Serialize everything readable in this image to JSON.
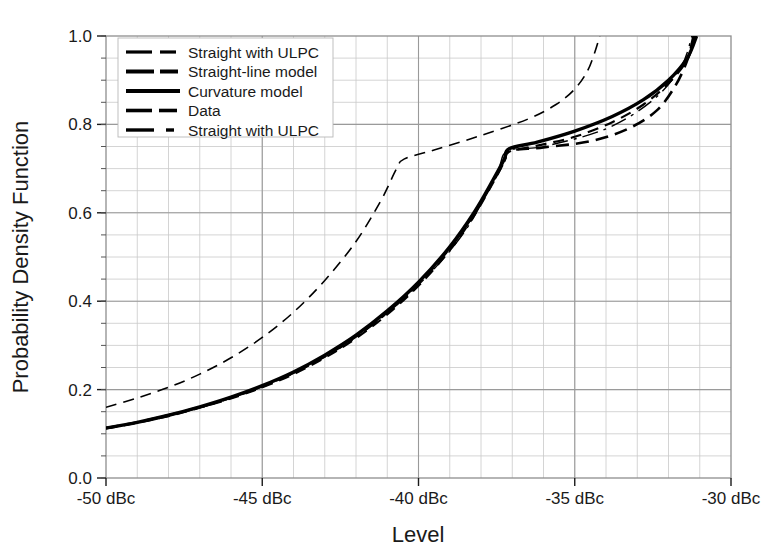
{
  "chart_data": {
    "type": "line",
    "title": "",
    "xlabel": "Level",
    "ylabel": "Probability Density Function",
    "xlim": [
      -50,
      -30
    ],
    "ylim": [
      0.0,
      1.0
    ],
    "grid": true,
    "legend_position": "top-left",
    "x_tick_labels": [
      "-50 dBc",
      "-45 dBc",
      "-40 dBc",
      "-35 dBc",
      "-30 dBc"
    ],
    "x_tick_values": [
      -50,
      -45,
      -40,
      -35,
      -30
    ],
    "y_tick_labels": [
      "0.0",
      "0.2",
      "0.4",
      "0.6",
      "0.8",
      "1.0"
    ],
    "y_tick_values": [
      0.0,
      0.2,
      0.4,
      0.6,
      0.8,
      1.0
    ],
    "x_minor_step": 1,
    "y_minor_step": 0.05,
    "series": [
      {
        "name": "Straight with ULPC",
        "style": "dashed",
        "width": 1.6,
        "points": [
          [
            -50.0,
            0.16
          ],
          [
            -49.0,
            0.181
          ],
          [
            -48.0,
            0.205
          ],
          [
            -47.0,
            0.235
          ],
          [
            -46.0,
            0.272
          ],
          [
            -45.0,
            0.318
          ],
          [
            -44.0,
            0.375
          ],
          [
            -43.0,
            0.447
          ],
          [
            -42.0,
            0.535
          ],
          [
            -41.2,
            0.628
          ],
          [
            -40.7,
            0.7
          ],
          [
            -40.45,
            0.722
          ],
          [
            -39.5,
            0.742
          ],
          [
            -38.0,
            0.775
          ],
          [
            -36.5,
            0.812
          ],
          [
            -35.6,
            0.845
          ],
          [
            -35.0,
            0.88
          ],
          [
            -34.6,
            0.92
          ],
          [
            -34.35,
            0.965
          ],
          [
            -34.2,
            1.0
          ]
        ]
      },
      {
        "name": "Straight-line model",
        "style": "dashed",
        "width": 2.6,
        "points": [
          [
            -50.0,
            0.113
          ],
          [
            -49.0,
            0.126
          ],
          [
            -48.0,
            0.142
          ],
          [
            -47.0,
            0.16
          ],
          [
            -46.0,
            0.182
          ],
          [
            -45.0,
            0.207
          ],
          [
            -44.0,
            0.238
          ],
          [
            -43.0,
            0.275
          ],
          [
            -42.0,
            0.32
          ],
          [
            -41.0,
            0.375
          ],
          [
            -40.0,
            0.44
          ],
          [
            -39.0,
            0.52
          ],
          [
            -38.2,
            0.6
          ],
          [
            -37.6,
            0.672
          ],
          [
            -37.25,
            0.718
          ],
          [
            -37.1,
            0.74
          ],
          [
            -36.0,
            0.748
          ],
          [
            -34.5,
            0.762
          ],
          [
            -33.3,
            0.79
          ],
          [
            -32.4,
            0.83
          ],
          [
            -31.8,
            0.885
          ],
          [
            -31.4,
            0.945
          ],
          [
            -31.2,
            1.0
          ]
        ]
      },
      {
        "name": "Curvature model",
        "style": "solid",
        "width": 3.4,
        "points": [
          [
            -50.0,
            0.113
          ],
          [
            -49.0,
            0.126
          ],
          [
            -48.0,
            0.142
          ],
          [
            -47.0,
            0.161
          ],
          [
            -46.0,
            0.183
          ],
          [
            -45.0,
            0.209
          ],
          [
            -44.0,
            0.24
          ],
          [
            -43.0,
            0.278
          ],
          [
            -42.0,
            0.323
          ],
          [
            -41.0,
            0.378
          ],
          [
            -40.0,
            0.443
          ],
          [
            -39.0,
            0.523
          ],
          [
            -38.2,
            0.603
          ],
          [
            -37.6,
            0.676
          ],
          [
            -37.25,
            0.722
          ],
          [
            -37.1,
            0.745
          ],
          [
            -36.2,
            0.76
          ],
          [
            -35.0,
            0.785
          ],
          [
            -33.8,
            0.818
          ],
          [
            -32.8,
            0.856
          ],
          [
            -32.0,
            0.9
          ],
          [
            -31.4,
            0.95
          ],
          [
            -31.1,
            1.0
          ]
        ]
      },
      {
        "name": "Data",
        "style": "dashed",
        "width": 2.2,
        "points": [
          [
            -50.0,
            0.112
          ],
          [
            -49.0,
            0.125
          ],
          [
            -48.0,
            0.14
          ],
          [
            -47.0,
            0.159
          ],
          [
            -46.0,
            0.18
          ],
          [
            -45.0,
            0.205
          ],
          [
            -44.0,
            0.235
          ],
          [
            -43.0,
            0.272
          ],
          [
            -42.0,
            0.316
          ],
          [
            -41.0,
            0.37
          ],
          [
            -40.0,
            0.435
          ],
          [
            -39.0,
            0.515
          ],
          [
            -38.2,
            0.596
          ],
          [
            -37.6,
            0.67
          ],
          [
            -37.25,
            0.716
          ],
          [
            -37.1,
            0.738
          ],
          [
            -36.2,
            0.752
          ],
          [
            -35.0,
            0.772
          ],
          [
            -33.8,
            0.805
          ],
          [
            -32.8,
            0.845
          ],
          [
            -32.0,
            0.893
          ],
          [
            -31.4,
            0.946
          ],
          [
            -31.15,
            1.0
          ]
        ]
      },
      {
        "name": "Straight with ULPC",
        "style": "dashdot",
        "width": 1.4,
        "points": [
          [
            -50.0,
            0.112
          ],
          [
            -48.0,
            0.141
          ],
          [
            -46.0,
            0.181
          ],
          [
            -44.0,
            0.237
          ],
          [
            -42.0,
            0.318
          ],
          [
            -40.0,
            0.437
          ],
          [
            -38.5,
            0.56
          ],
          [
            -37.5,
            0.69
          ],
          [
            -37.15,
            0.74
          ],
          [
            -36.0,
            0.75
          ],
          [
            -34.0,
            0.79
          ],
          [
            -32.5,
            0.855
          ],
          [
            -31.6,
            0.93
          ],
          [
            -31.25,
            1.0
          ]
        ]
      }
    ]
  },
  "legend": {
    "entries": [
      {
        "label": "Straight with ULPC",
        "style": "dashed-thin"
      },
      {
        "label": "Straight-line model",
        "style": "dashed-thick"
      },
      {
        "label": "Curvature model",
        "style": "solid"
      },
      {
        "label": "Data",
        "style": "dashed-med"
      },
      {
        "label": "Straight with ULPC",
        "style": "dashdot"
      }
    ]
  },
  "colors": {
    "series": "#000000",
    "grid_minor": "#c9c9c9",
    "grid_major": "#9a9a9a",
    "background": "#ffffff",
    "text": "#1a1a1a"
  }
}
